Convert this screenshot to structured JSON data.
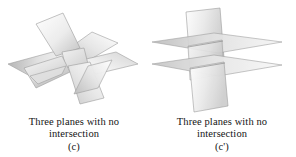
{
  "figure_set": {
    "background_color": "#ffffff",
    "text_color": "#141414",
    "plane_fill_light": "#fbfbfb",
    "plane_fill_mid": "#d8d8d8",
    "plane_fill_dark": "#a8a8a8",
    "plane_edge_color": "#9a9a9a"
  },
  "panels": [
    {
      "id": "c",
      "diagram_name": "three-planes-pinwheel",
      "caption_line1": "Three planes with no",
      "caption_line2": "intersection",
      "tag": "(c)",
      "description": "Three planes crossing pairwise in a pinwheel/star arrangement forming a triangular prism opening at the center, so no point is common to all three"
    },
    {
      "id": "c-prime",
      "diagram_name": "three-planes-vertical-with-two-parallel",
      "caption_line1": "Three planes with no",
      "caption_line2": "intersection",
      "tag": "(c')",
      "description": "One vertical plane cut by two parallel horizontal planes, giving two parallel lines of intersection and no common point"
    }
  ]
}
